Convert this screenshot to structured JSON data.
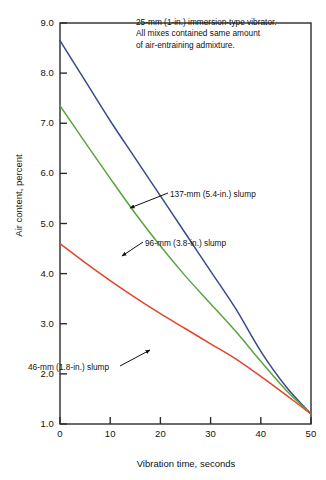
{
  "chart_data": {
    "type": "line",
    "title": "",
    "xlabel": "Vibration time, seconds",
    "ylabel": "Air content, percent",
    "xlim": [
      0,
      50
    ],
    "ylim": [
      1.0,
      9.0
    ],
    "grid": false,
    "legend_position": "inline-callouts",
    "xticks": [
      "0",
      "10",
      "20",
      "30",
      "40",
      "50"
    ],
    "xtick_values": [
      0,
      10,
      20,
      30,
      40,
      50
    ],
    "yticks": [
      "1.0",
      "2.0",
      "3.0",
      "4.0",
      "5.0",
      "6.0",
      "7.0",
      "8.0",
      "9.0"
    ],
    "ytick_values": [
      1.0,
      2.0,
      3.0,
      4.0,
      5.0,
      6.0,
      7.0,
      8.0,
      9.0
    ],
    "annotations": [
      "25-mm (1-in.) immersion-type vibrator.",
      "All mixes contained same amount",
      "of air-entraining admixture."
    ],
    "x": [
      0,
      5,
      10,
      15,
      20,
      25,
      30,
      35,
      40,
      45,
      50
    ],
    "series": [
      {
        "name": "137-mm (5.4-in.) slump",
        "label": "137-mm (5.4-in.) slump",
        "color": "#3b4a8c",
        "values": [
          8.65,
          7.85,
          7.05,
          6.3,
          5.55,
          4.8,
          4.05,
          3.3,
          2.45,
          1.75,
          1.2
        ]
      },
      {
        "name": "96-mm (3.8-in.) slump",
        "label": "96-mm (3.8-in.) slump",
        "color": "#5ba33f",
        "values": [
          7.35,
          6.62,
          5.9,
          5.2,
          4.55,
          3.95,
          3.4,
          2.85,
          2.25,
          1.68,
          1.2
        ]
      },
      {
        "name": "46-mm (1.8-in.) slump",
        "label": "46-mm (1.8-in.) slump",
        "color": "#e2452b",
        "values": [
          4.6,
          4.22,
          3.86,
          3.52,
          3.2,
          2.9,
          2.6,
          2.3,
          1.95,
          1.58,
          1.2
        ]
      }
    ]
  },
  "axis": {
    "frame_color": "#2b2b2b"
  }
}
